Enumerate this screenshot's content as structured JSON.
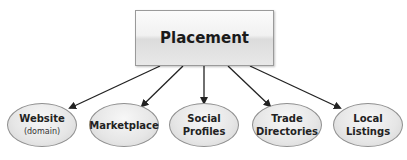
{
  "diagram": {
    "root": {
      "label": "Placement"
    },
    "children": [
      {
        "label_line1": "Website",
        "label_line2": "",
        "sub": "(domain)"
      },
      {
        "label_line1": "Marketplace",
        "label_line2": "",
        "sub": ""
      },
      {
        "label_line1": "Social",
        "label_line2": "Profiles",
        "sub": ""
      },
      {
        "label_line1": "Trade",
        "label_line2": "Directories",
        "sub": ""
      },
      {
        "label_line1": "Local",
        "label_line2": "Listings",
        "sub": ""
      }
    ],
    "colors": {
      "arrow": "#222222",
      "node_border": "#8f8f8f",
      "node_fill": "#e6e6e6"
    }
  }
}
